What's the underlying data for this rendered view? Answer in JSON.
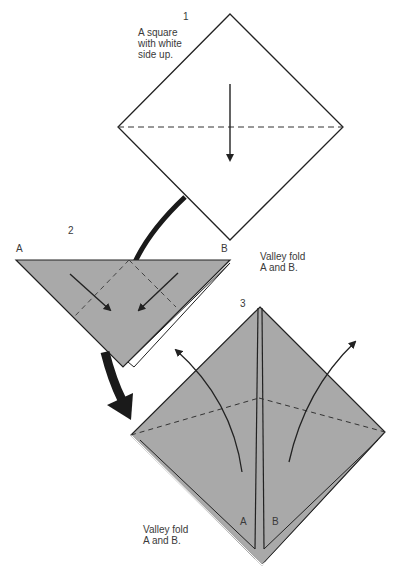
{
  "colors": {
    "paper_white": "#ffffff",
    "paper_colored": "#a9a9a9",
    "line": "#222222"
  },
  "steps": [
    {
      "number": "1",
      "caption_line1": "A square",
      "caption_line2": "with white",
      "caption_line3": "side up."
    },
    {
      "number": "2",
      "corner_a": "A",
      "corner_b": "B",
      "caption_line1": "Valley fold",
      "caption_line2": "A and B."
    },
    {
      "number": "3",
      "flap_a": "A",
      "flap_b": "B",
      "caption_line1": "Valley fold",
      "caption_line2": "A and B."
    }
  ]
}
